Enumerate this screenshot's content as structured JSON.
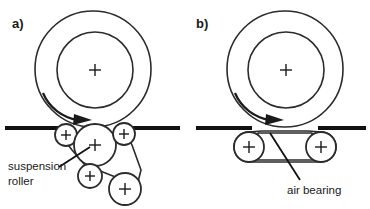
{
  "figure": {
    "background_color": "#ffffff",
    "line_color": "#2b2b2b",
    "text_color": "#1a1a1a"
  },
  "panels": [
    {
      "id": "a",
      "label": "a)",
      "annotation": {
        "line1": "suspension",
        "line2": "roller"
      },
      "drum": {
        "center_marker": "+",
        "rotation": "clockwise"
      },
      "rollers": [
        {
          "name": "upper-left-roller",
          "marker": "+"
        },
        {
          "name": "center-suspension-roller",
          "marker": "+"
        },
        {
          "name": "upper-right-roller",
          "marker": "+"
        },
        {
          "name": "lower-left-roller",
          "marker": "+"
        },
        {
          "name": "lower-right-roller",
          "marker": "+"
        }
      ]
    },
    {
      "id": "b",
      "label": "b)",
      "annotation": {
        "line1": "air bearing",
        "line2": ""
      },
      "drum": {
        "center_marker": "+",
        "rotation": "clockwise"
      },
      "rollers": [
        {
          "name": "left-roller",
          "marker": "+"
        },
        {
          "name": "right-roller",
          "marker": "+"
        }
      ]
    }
  ]
}
